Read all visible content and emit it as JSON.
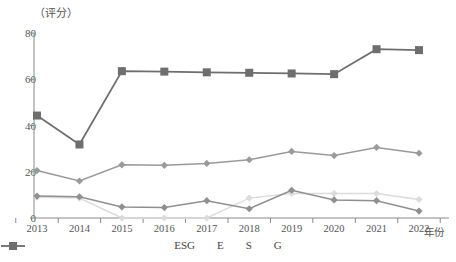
{
  "chart_data": {
    "type": "line",
    "title": "",
    "subtitle": "",
    "y_unit_label": "（评分）",
    "xlabel": "年份",
    "ylabel": "",
    "categories": [
      "2013",
      "2014",
      "2015",
      "2016",
      "2017",
      "2018",
      "2019",
      "2020",
      "2021",
      "2022"
    ],
    "ylim": [
      0,
      80
    ],
    "yticks": [
      0,
      20,
      40,
      60,
      80
    ],
    "grid": false,
    "legend_position": "bottom",
    "series": [
      {
        "name": "ESG",
        "color": "#9a9a9a",
        "marker": "diamond",
        "values": [
          20.5,
          16.0,
          23.0,
          22.8,
          23.6,
          25.2,
          28.8,
          27.0,
          30.5,
          28.0
        ]
      },
      {
        "name": "E",
        "color": "#dcdcdc",
        "marker": "diamond",
        "values": [
          9.0,
          8.6,
          0.0,
          0.0,
          0.0,
          8.6,
          10.6,
          10.6,
          10.6,
          8.0
        ]
      },
      {
        "name": "S",
        "color": "#8f8f8f",
        "marker": "diamond",
        "values": [
          9.5,
          9.2,
          4.8,
          4.5,
          7.5,
          4.0,
          12.0,
          7.8,
          7.5,
          3.0
        ]
      },
      {
        "name": "G",
        "color": "#6e6e6e",
        "marker": "square",
        "values": [
          44.3,
          31.8,
          63.5,
          63.3,
          63.0,
          62.8,
          62.5,
          62.2,
          73.0,
          72.6
        ]
      }
    ]
  },
  "legend": {
    "items": [
      {
        "label": "ESG"
      },
      {
        "label": "E"
      },
      {
        "label": "S"
      },
      {
        "label": "G"
      }
    ]
  }
}
